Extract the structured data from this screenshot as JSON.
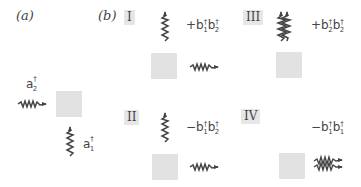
{
  "panels": {
    "a": {
      "label": "(a)",
      "operators": [
        {
          "symbol": "a",
          "sub": "2",
          "sup": "†",
          "wave": "horizontal-right"
        },
        {
          "symbol": "a",
          "sub": "1",
          "sup": "†",
          "wave": "vertical-up"
        }
      ]
    },
    "b": {
      "label": "(b)",
      "cases": [
        {
          "id": "I",
          "sign": "+",
          "term": [
            {
              "s": "b",
              "sub": "1",
              "sup": "†"
            },
            {
              "s": "b",
              "sub": "2",
              "sup": "†"
            }
          ],
          "waves": [
            "vertical-up",
            "horizontal-right"
          ]
        },
        {
          "id": "II",
          "sign": "−",
          "term": [
            {
              "s": "b",
              "sub": "1",
              "sup": "†"
            },
            {
              "s": "b",
              "sub": "2",
              "sup": "†"
            }
          ],
          "waves": [
            "vertical-up",
            "horizontal-right"
          ]
        },
        {
          "id": "III",
          "sign": "+",
          "term": [
            {
              "s": "b",
              "sub": "2",
              "sup": "†"
            },
            {
              "s": "b",
              "sub": "2",
              "sup": "†"
            }
          ],
          "waves": [
            "double-vertical-up"
          ]
        },
        {
          "id": "IV",
          "sign": "−",
          "term": [
            {
              "s": "b",
              "sub": "1",
              "sup": "†"
            },
            {
              "s": "b",
              "sub": "1",
              "sup": "†"
            }
          ],
          "waves": [
            "double-horizontal-right"
          ]
        }
      ]
    }
  },
  "colors": {
    "square": "#e2e2e2",
    "label_bg": "#e6e6e6",
    "wave": "#444444"
  }
}
